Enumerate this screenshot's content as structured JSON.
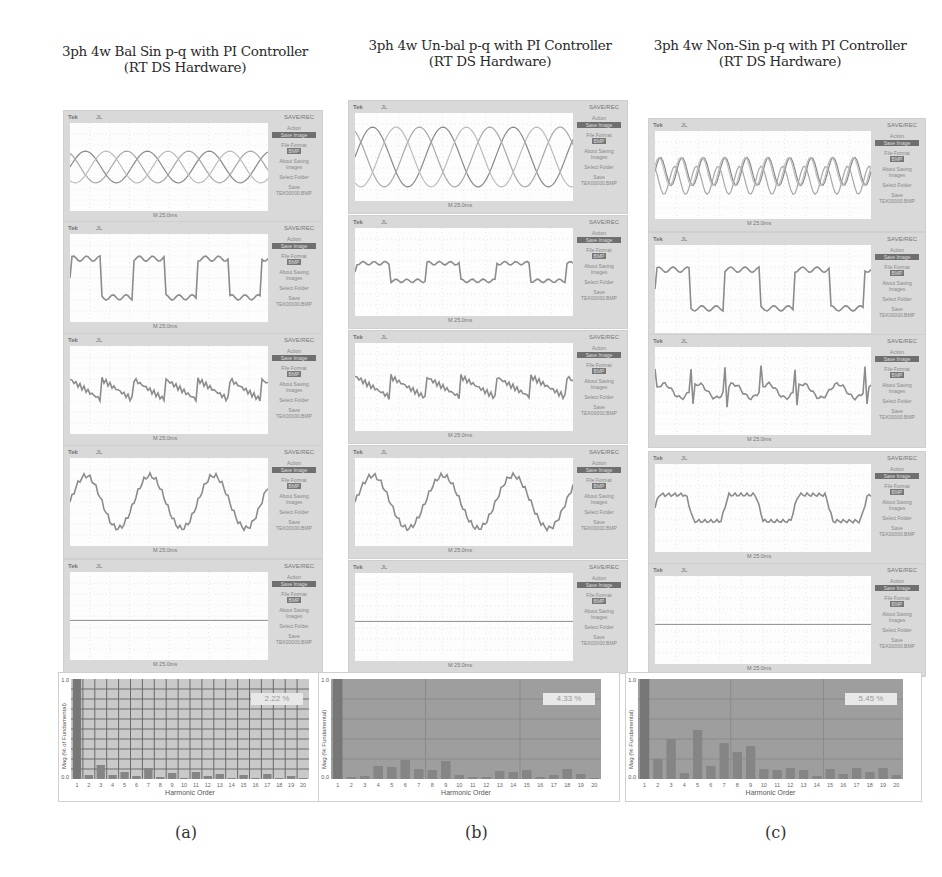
{
  "panels": [
    {
      "id": "a",
      "title_line1": "3ph 4w Bal Sin p-q with PI Controller",
      "title_line2": "(RT DS Hardware)",
      "caption": "(a)",
      "thd": "2.22 %",
      "xlabel": "Harmonic Order",
      "ylabel": "Mag (% of Fundamental)"
    },
    {
      "id": "b",
      "title_line1": "3ph 4w Un-bal p-q with PI Controller",
      "title_line2": "(RT DS Hardware)",
      "caption": "(b)",
      "thd": "4.33 %",
      "xlabel": "Harmonic Order",
      "ylabel": "Mag (% Fundamental)"
    },
    {
      "id": "c",
      "title_line1": "3ph 4w Non-Sin p-q with PI Controller",
      "title_line2": "(RT DS Hardware)",
      "caption": "(c)",
      "thd": "5.45 %",
      "xlabel": "Harmonic Order",
      "ylabel": "Mag (% Fundamental)"
    }
  ],
  "scope": {
    "brand": "Tek",
    "trigger": "JL",
    "menu_title": "SAVE/REC",
    "action_label": "Action",
    "action_value": "Save Image",
    "file_format_label": "File Format",
    "file_format_value": "BMP",
    "about_label": "About Saving Images",
    "select_folder": "Select Folder",
    "save_label": "Save TEK00000.BMP",
    "time_base": "M 25.0ms"
  },
  "scope_traces": [
    "Three-phase source voltages",
    "Load current",
    "Compensating current",
    "Source current",
    "Neutral current"
  ],
  "chart_data": [
    {
      "type": "bar",
      "title": "3ph 4w Bal Sin p-q with PI Controller (RT DS Hardware) - Source current harmonic spectrum",
      "xlabel": "Harmonic Order",
      "ylabel": "Mag (% of Fundamental)",
      "ylim": [
        0,
        1.0
      ],
      "y_ticks": [
        "0.0",
        "1.0"
      ],
      "categories": [
        "1",
        "2",
        "3",
        "4",
        "5",
        "6",
        "7",
        "8",
        "9",
        "10",
        "11",
        "12",
        "13",
        "14",
        "15",
        "16",
        "17",
        "18",
        "19",
        "20"
      ],
      "values": [
        1.0,
        0.04,
        0.14,
        0.04,
        0.07,
        0.03,
        0.11,
        0.02,
        0.06,
        0.01,
        0.07,
        0.03,
        0.05,
        0.01,
        0.04,
        0.01,
        0.05,
        0.01,
        0.03,
        0.01
      ],
      "annotation": "THD 2.22 %",
      "grid": true
    },
    {
      "type": "bar",
      "title": "3ph 4w Un-bal p-q with PI Controller (RT DS Hardware) - Source current harmonic spectrum",
      "xlabel": "Harmonic Order",
      "ylabel": "Mag (% Fundamental)",
      "ylim": [
        0,
        1.0
      ],
      "y_ticks": [
        "0.0",
        "1.0"
      ],
      "categories": [
        "1",
        "2",
        "3",
        "4",
        "5",
        "6",
        "7",
        "8",
        "9",
        "10",
        "11",
        "12",
        "13",
        "14",
        "15",
        "16",
        "17",
        "18",
        "19",
        "20"
      ],
      "values": [
        1.0,
        0.02,
        0.03,
        0.13,
        0.12,
        0.19,
        0.1,
        0.09,
        0.18,
        0.04,
        0.02,
        0.02,
        0.08,
        0.07,
        0.09,
        0.02,
        0.04,
        0.1,
        0.05,
        0.01
      ],
      "annotation": "THD 4.33 %",
      "grid": true
    },
    {
      "type": "bar",
      "title": "3ph 4w Non-Sin p-q with PI Controller (RT DS Hardware) - Source current harmonic spectrum",
      "xlabel": "Harmonic Order",
      "ylabel": "Mag (% Fundamental)",
      "ylim": [
        0,
        1.0
      ],
      "y_ticks": [
        "0.0",
        "1.0"
      ],
      "categories": [
        "1",
        "2",
        "3",
        "4",
        "5",
        "6",
        "7",
        "8",
        "9",
        "10",
        "11",
        "12",
        "13",
        "14",
        "15",
        "16",
        "17",
        "18",
        "19",
        "20"
      ],
      "values": [
        1.0,
        0.2,
        0.4,
        0.06,
        0.49,
        0.13,
        0.36,
        0.27,
        0.33,
        0.1,
        0.09,
        0.11,
        0.09,
        0.03,
        0.1,
        0.05,
        0.11,
        0.07,
        0.11,
        0.04
      ],
      "annotation": "THD 5.45 %",
      "grid": true
    }
  ]
}
